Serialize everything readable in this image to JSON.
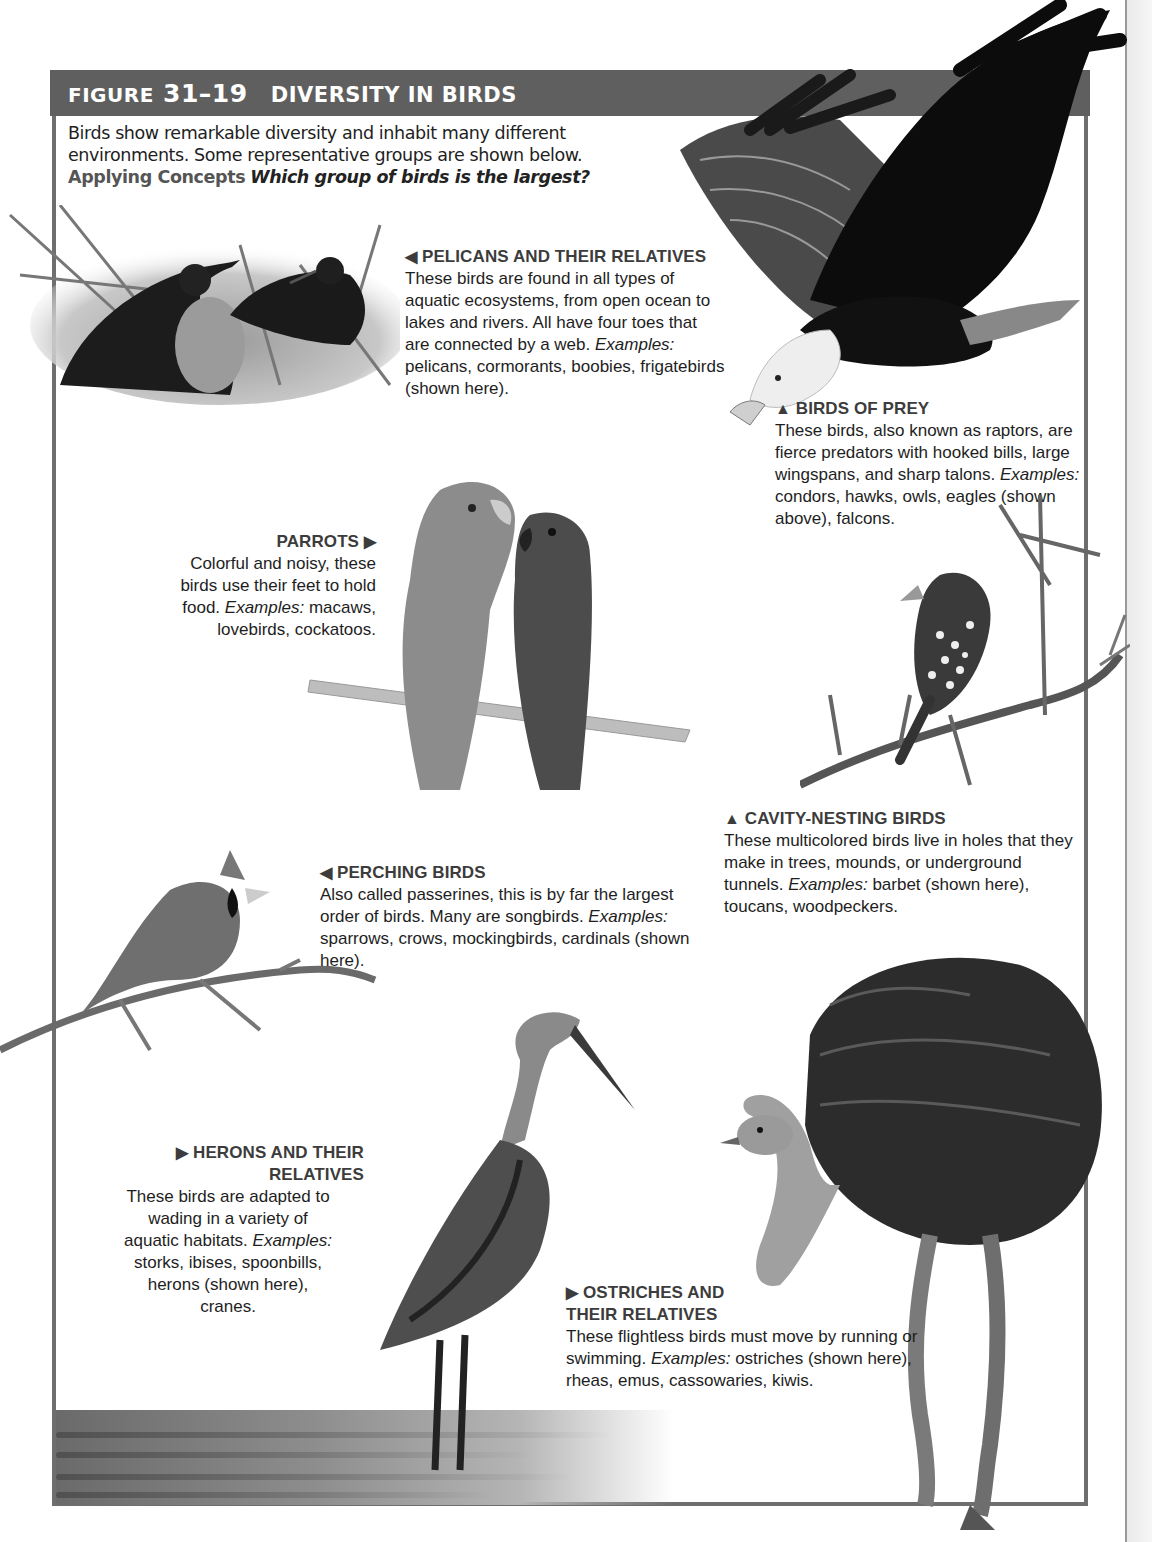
{
  "figure": {
    "label_prefix": "Figure",
    "number": "31–19",
    "title": "Diversity in Birds",
    "header_color": "#5f5f5f",
    "border_color": "#6e6e6e"
  },
  "intro": {
    "text": "Birds show remarkable diversity and inhabit many different environments. Some representative groups are shown below.",
    "applying_label": "Applying Concepts",
    "question": "Which group of birds is the largest?"
  },
  "captions": {
    "pelicans": {
      "arrow": "◀",
      "heading": "PELICANS AND THEIR RELATIVES",
      "body": "These birds are found in all types of aquatic ecosystems, from open ocean to lakes and rivers. All have four toes that are connected by a web.",
      "examples_label": "Examples:",
      "examples": "pelicans, cormorants, boobies, frigatebirds (shown here)."
    },
    "birds_of_prey": {
      "arrow": "▲",
      "heading": "BIRDS OF PREY",
      "body": "These birds, also known as raptors, are fierce predators with hooked bills, large wingspans, and sharp talons.",
      "examples_label": "Examples:",
      "examples": "condors, hawks, owls, eagles (shown above), falcons."
    },
    "parrots": {
      "arrow": "▶",
      "heading": "PARROTS",
      "body": "Colorful and noisy, these birds use their feet to hold food.",
      "examples_label": "Examples:",
      "examples": "macaws, lovebirds, cockatoos."
    },
    "cavity_nesting": {
      "arrow": "▲",
      "heading": "CAVITY-NESTING BIRDS",
      "body": "These multicolored birds live in holes that they make in trees, mounds, or underground tunnels.",
      "examples_label": "Examples:",
      "examples": "barbet (shown here), toucans, woodpeckers."
    },
    "perching": {
      "arrow": "◀",
      "heading": "PERCHING BIRDS",
      "body": "Also called passerines, this is by far the largest order of birds. Many are songbirds.",
      "examples_label": "Examples:",
      "examples": "sparrows, crows, mockingbirds, cardinals (shown here)."
    },
    "herons": {
      "arrow": "▶",
      "heading": "HERONS AND THEIR RELATIVES",
      "body": "These birds are adapted to wading in a variety of aquatic habitats.",
      "examples_label": "Examples:",
      "examples": "storks, ibises, spoonbills, herons (shown here), cranes."
    },
    "ostriches": {
      "arrow": "▶",
      "heading": "OSTRICHES AND THEIR RELATIVES",
      "body": "These flightless birds must move by running or swimming.",
      "examples_label": "Examples:",
      "examples": "ostriches (shown here), rheas, emus, cassowaries, kiwis."
    }
  },
  "photos": {
    "frigatebirds": "frigatebirds-on-nest",
    "eagle": "bald-eagle-in-flight",
    "parrots": "pair-of-eclectus-parrots",
    "barbet": "barbet-on-thorny-branch",
    "cardinal": "cardinal-on-branch",
    "heron": "great-blue-heron-wading",
    "ostrich": "ostrich-standing"
  }
}
